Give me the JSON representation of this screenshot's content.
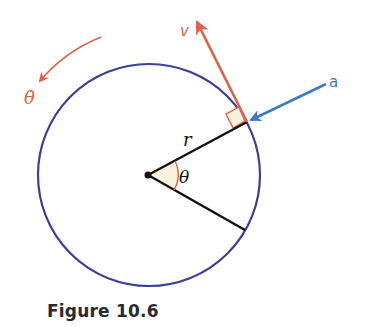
{
  "figure": {
    "caption": "Figure 10.6",
    "labels": {
      "theta_dot": "θ̇",
      "velocity": "v",
      "acceleration": "a",
      "radius": "r",
      "angle": "θ"
    },
    "colors": {
      "circle": "#3c3f97",
      "velocity": "#e0604a",
      "acceleration": "#3a7bc4",
      "radius_lines": "#111111",
      "angle_fill": "#fbf1dc",
      "angle_arc": "#e0604a",
      "right_angle_marker": "#e0604a",
      "theta_dot_arrow": "#e0604a",
      "caption": "#2a2a2a"
    }
  }
}
